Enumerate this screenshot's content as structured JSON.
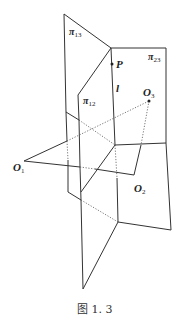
{
  "figure": {
    "caption": "图 1. 3",
    "labels": {
      "pi13": "π",
      "pi13_sub": "13",
      "pi23": "π",
      "pi23_sub": "23",
      "pi12": "π",
      "pi12_sub": "12",
      "P": "P",
      "l": "l",
      "O1": "O",
      "O1_sub": "1",
      "O2": "O",
      "O2_sub": "2",
      "O3": "O",
      "O3_sub": "3"
    },
    "colors": {
      "line": "#333333",
      "background": "#ffffff"
    }
  }
}
